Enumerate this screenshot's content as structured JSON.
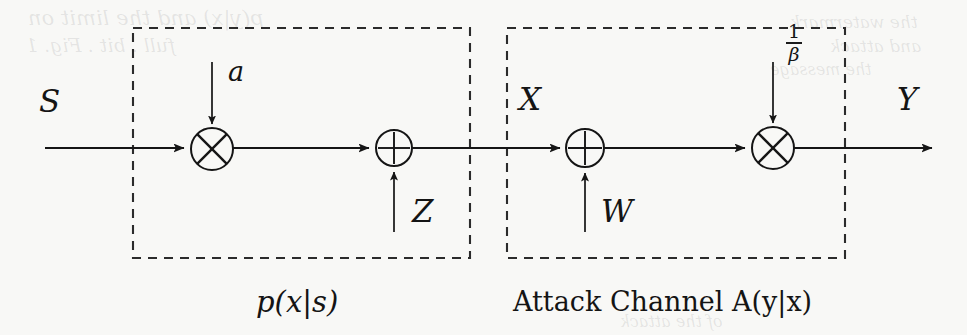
{
  "figure": {
    "type": "block-diagram",
    "background_color": "#f8f8f6",
    "ink_color": "#141414"
  },
  "signals": {
    "input_label": "S",
    "intermediate_label": "X",
    "output_label": "Y",
    "gain_label": "a",
    "noise_z_label": "Z",
    "noise_w_label": "W",
    "attack_gain_numerator": "1",
    "attack_gain_denominator": "β"
  },
  "blocks": [
    {
      "id": "embedder",
      "caption": "p(x|s)",
      "box": {
        "x": 133,
        "y": 28,
        "width": 337,
        "height": 230,
        "style": "dashed"
      },
      "nodes": [
        {
          "id": "mult-a",
          "kind": "multiplier",
          "glyph": "⊗",
          "cx": 212,
          "cy": 149,
          "r": 21
        },
        {
          "id": "add-z",
          "kind": "adder",
          "glyph": "⊕",
          "cx": 394,
          "cy": 148,
          "r": 18
        }
      ]
    },
    {
      "id": "attack-channel",
      "caption": "Attack Channel A(y|x)",
      "box": {
        "x": 507,
        "y": 28,
        "width": 338,
        "height": 230,
        "style": "dashed"
      },
      "nodes": [
        {
          "id": "add-w",
          "kind": "adder",
          "glyph": "⊕",
          "cx": 585,
          "cy": 148,
          "r": 19
        },
        {
          "id": "mult-beta",
          "kind": "multiplier",
          "glyph": "⊗",
          "cx": 773,
          "cy": 148,
          "r": 21
        }
      ]
    }
  ],
  "main_line": {
    "y": 148,
    "x_start": 45,
    "x_end": 932
  },
  "ghost_text": [
    {
      "text": "p(y|x) and the limit on",
      "x": 28,
      "y": 6
    },
    {
      "text": "full . bit . Fig. 1",
      "x": 26,
      "y": 34
    },
    {
      "text": "the watermark",
      "x": 790,
      "y": 12
    },
    {
      "text": "and attack",
      "x": 812,
      "y": 34
    },
    {
      "text": "the message",
      "x": 760,
      "y": 60
    },
    {
      "text": "of the attack",
      "x": 608,
      "y": 320
    }
  ]
}
